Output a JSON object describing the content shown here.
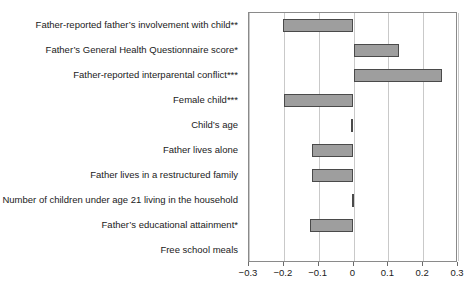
{
  "chart_data": {
    "type": "bar",
    "orientation": "horizontal",
    "title": "",
    "xlabel": "",
    "ylabel": "",
    "xlim": [
      -0.3,
      0.3
    ],
    "grid": true,
    "legend": null,
    "xticks": [
      -0.3,
      -0.2,
      -0.1,
      0,
      0.1,
      0.2,
      0.3
    ],
    "xticklabels": [
      "−0.3",
      "−0.2",
      "−0.1",
      "0",
      "0.1",
      "0.2",
      "0.3"
    ],
    "categories": [
      "Father-reported father’s involvement with child**",
      "Father’s General Health Questionnaire score*",
      "Father-reported interparental conflict***",
      "Female child***",
      "Child’s age",
      "Father lives alone",
      "Father lives in a restructured family",
      "Number of children under age 21 living in the household",
      "Father’s educational attainment*",
      "Free school meals"
    ],
    "values": [
      -0.202,
      0.132,
      0.253,
      -0.2,
      -0.006,
      -0.12,
      -0.12,
      -0.005,
      -0.126,
      0.0
    ],
    "bar_color": "#9e9e9e",
    "bar_edge_color": "#4a4a4a"
  }
}
